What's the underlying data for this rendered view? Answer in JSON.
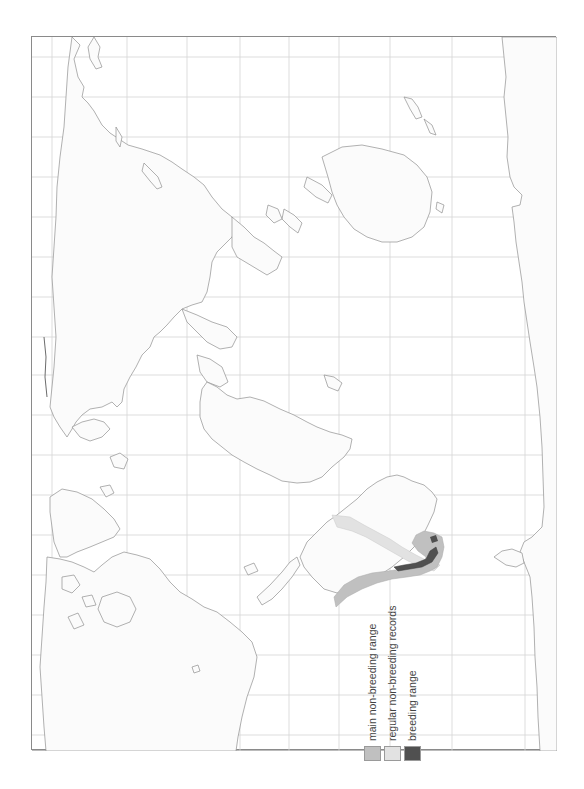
{
  "map": {
    "type": "species-range-map",
    "orientation": "rotated-90-ccw",
    "projection": "world outline with lat/long grid",
    "regions_highlighted": "southern South America (Patagonia, Falklands, southern Atlantic and Pacific coasts)",
    "colors": {
      "background": "#ffffff",
      "frame": "#8a8a8a",
      "grid": "#d4d4d4",
      "coastline": "#8f8f8f",
      "main_non_breeding": "#c0c0c0",
      "regular_non_breeding": "#e2e2e2",
      "breeding": "#505050"
    }
  },
  "legend": {
    "items": [
      {
        "label": "main non-breeding range",
        "color": "#c0c0c0"
      },
      {
        "label": "regular non-breeding records",
        "color": "#e2e2e2"
      },
      {
        "label": "breeding range",
        "color": "#505050"
      }
    ]
  }
}
